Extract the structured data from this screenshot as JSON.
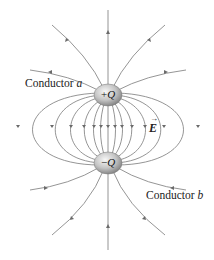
{
  "diagram": {
    "conductor_a": {
      "label": "Conductor",
      "letter": "a"
    },
    "conductor_b": {
      "label": "Conductor",
      "letter": "b"
    },
    "positive_charge": {
      "sign": "+",
      "symbol": "Q"
    },
    "negative_charge": {
      "sign": "−",
      "symbol": "Q"
    },
    "field_label": {
      "symbol": "E",
      "vector_arrow": "→"
    },
    "colors": {
      "field_line": "#6a6a6a",
      "sphere_light": "#f2f2f2",
      "sphere_dark": "#8a8a8a",
      "text": "#222222"
    }
  }
}
